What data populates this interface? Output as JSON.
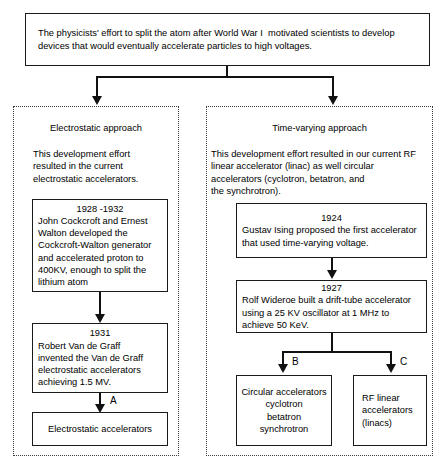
{
  "diagram": {
    "title_box": {
      "text": "The physicists' effort to split the atom after World War I  motivated scientists to develop devices that would eventually accelerate particles to high voltages."
    },
    "left_branch": {
      "heading": "Electrostatic approach",
      "description": "This development effort\nresulted in the current\nelectrostatic accelerators.",
      "nodes": [
        {
          "year": "1928 -1932",
          "text": "John Cockcroft and Ernest\nWalton developed the\nCockcroft-Walton generator\nand accelerated proton to\n400KV, enough to split the\nlithium atom"
        },
        {
          "year": "1931",
          "text": "Robert Van de Graff\ninvented the Van de Graff\nelectrostatic accelerators\nachieving 1.5 MV."
        }
      ],
      "edge_label": "A",
      "outcome": "Electrostatic accelerators"
    },
    "right_branch": {
      "heading": "Time-varying approach",
      "description": "This development effort resulted in our current RF\nlinear accelerator (linac) as well circular\naccelerators (cyclotron, betatron, and\nthe synchrotron).",
      "nodes": [
        {
          "year": "1924",
          "text": "Gustav Ising proposed the first accelerator\nthat used time-varying voltage."
        },
        {
          "year": "1927",
          "text": "Rolf Wideroe built a drift-tube accelerator\nusing a 25 KV oscillator at 1 MHz to\nachieve 50 KeV."
        }
      ],
      "edge_label_left": "B",
      "edge_label_right": "C",
      "outcome_left": "Circular accelerators\ncyclotron\nbetatron\nsynchrotron",
      "outcome_right": "RF linear\naccelerators\n(linacs)"
    }
  },
  "colors": {
    "stroke": "#111111",
    "panel_stroke": "#3a3a3a",
    "background": "#ffffff",
    "text": "#000000"
  }
}
